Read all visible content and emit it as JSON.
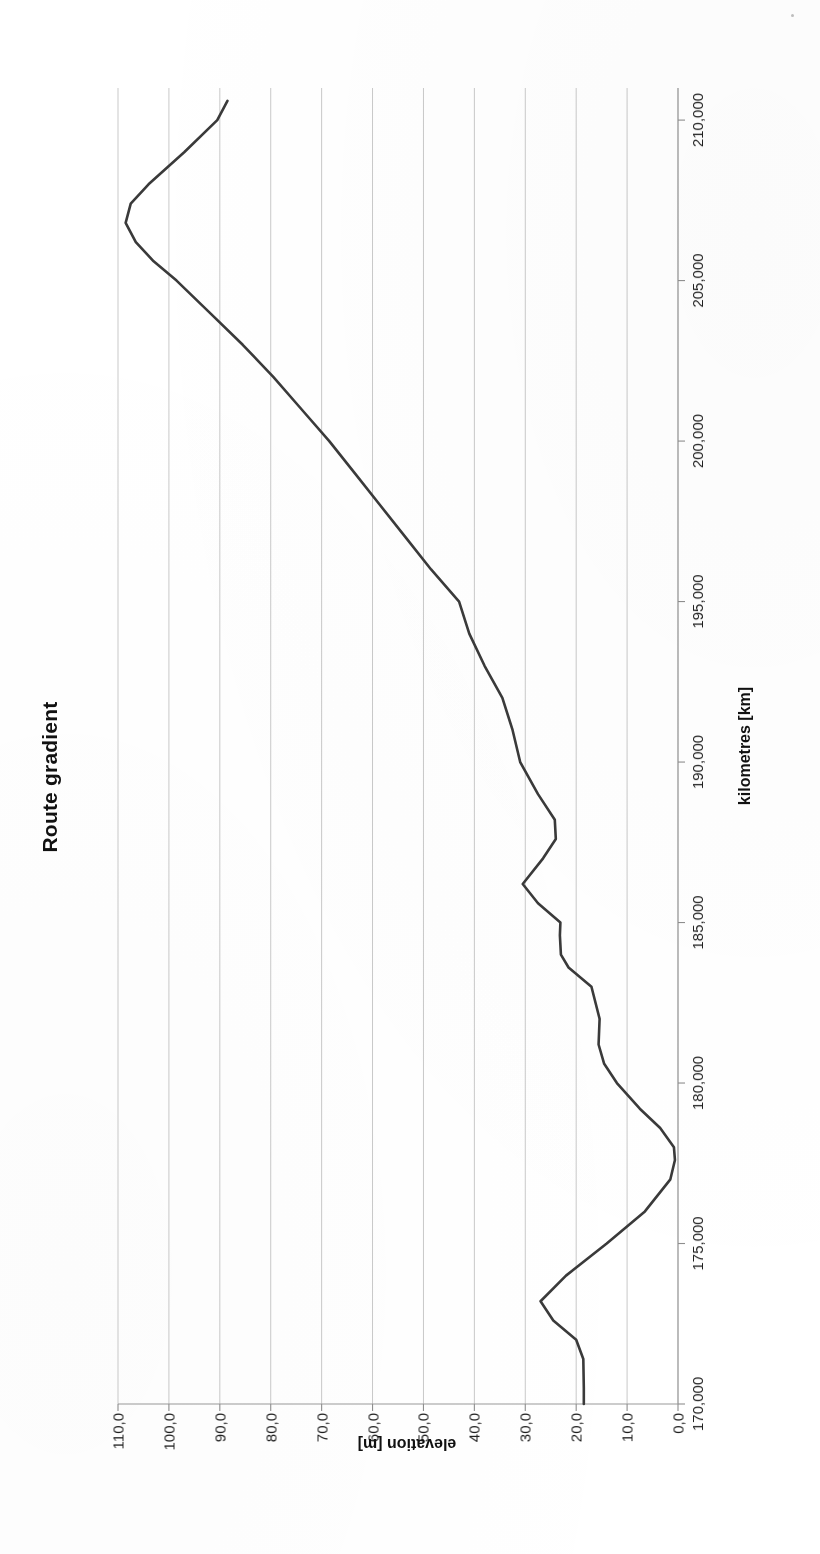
{
  "document": {
    "kind": "scanned-chart-page",
    "rotation_degrees": -90
  },
  "chart": {
    "title": "Route gradient",
    "x_axis_title": "kilometres [km]",
    "y_axis_title": "elevation [m]"
  },
  "chart_data": {
    "type": "line",
    "title": "Route gradient",
    "xlabel": "kilometres [km]",
    "ylabel": "elevation [m]",
    "xlim": [
      170000,
      211000
    ],
    "ylim": [
      0,
      110
    ],
    "xtick_labels": [
      "170,000",
      "175,000",
      "180,000",
      "185,000",
      "190,000",
      "195,000",
      "200,000",
      "205,000",
      "210,000"
    ],
    "xticks": [
      170000,
      175000,
      180000,
      185000,
      190000,
      195000,
      200000,
      205000,
      210000
    ],
    "ytick_labels": [
      "0,0",
      "10,0",
      "20,0",
      "30,0",
      "40,0",
      "50,0",
      "60,0",
      "70,0",
      "80,0",
      "90,0",
      "100,0",
      "110,0"
    ],
    "yticks": [
      0,
      10,
      20,
      30,
      40,
      50,
      60,
      70,
      80,
      90,
      100,
      110
    ],
    "grid": "y-only-horizontal-in-landscape",
    "legend": null,
    "series": [
      {
        "name": "elevation",
        "x": [
          170000,
          170500,
          171400,
          172000,
          172600,
          173200,
          174000,
          175000,
          176000,
          177000,
          177600,
          178000,
          178600,
          179200,
          180000,
          180600,
          181200,
          182000,
          183000,
          183600,
          184000,
          184600,
          185000,
          185600,
          186200,
          187000,
          187600,
          188200,
          189000,
          190000,
          191000,
          192000,
          193000,
          194000,
          195000,
          196000,
          197000,
          198000,
          199000,
          200000,
          201000,
          202000,
          203000,
          204000,
          205000,
          205600,
          206200,
          206800,
          207400,
          208000,
          209000,
          210000,
          210600
        ],
        "y": [
          18.5,
          18.5,
          18.6,
          20.0,
          24.5,
          27.0,
          22.0,
          14.0,
          6.5,
          1.5,
          0.6,
          0.8,
          3.5,
          7.5,
          12.0,
          14.5,
          15.6,
          15.4,
          17.0,
          21.5,
          23.0,
          23.2,
          23.1,
          27.5,
          30.5,
          26.5,
          24.0,
          24.2,
          27.5,
          31.0,
          32.5,
          34.5,
          38.0,
          41.0,
          43.0,
          48.5,
          53.5,
          58.5,
          63.5,
          68.5,
          74.0,
          79.5,
          85.5,
          92.0,
          98.5,
          103.0,
          106.5,
          108.5,
          107.5,
          104.0,
          97.0,
          90.5,
          88.5
        ]
      }
    ]
  }
}
